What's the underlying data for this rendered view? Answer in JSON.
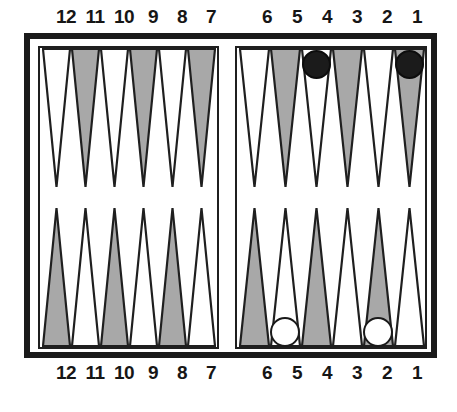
{
  "figure": {
    "kind": "backgammon-board-diagram",
    "caption_faint": "",
    "colors": {
      "frame": "#1a1a1a",
      "point_light": "#ffffff",
      "point_dark": "#a8a8a8",
      "point_outline": "#1f1f1f",
      "checker_white": "#ffffff",
      "checker_black": "#1b1b1b",
      "background": "#ffffff"
    }
  },
  "top_labels": {
    "left_group": [
      "12",
      "11",
      "10",
      "9",
      "8",
      "7"
    ],
    "right_group": [
      "6",
      "5",
      "4",
      "3",
      "2",
      "1"
    ]
  },
  "bottom_labels": {
    "left_group": [
      "12",
      "11",
      "10",
      "9",
      "8",
      "7"
    ],
    "right_group": [
      "6",
      "5",
      "4",
      "3",
      "2",
      "1"
    ]
  },
  "board": {
    "quadrants": {
      "top_left": {
        "name": "top-left-quadrant",
        "point_numbers": [
          "12",
          "11",
          "10",
          "9",
          "8",
          "7"
        ],
        "point_shades": [
          "light",
          "dark",
          "light",
          "dark",
          "light",
          "dark"
        ],
        "checkers": []
      },
      "top_right": {
        "name": "top-right-quadrant",
        "point_numbers": [
          "6",
          "5",
          "4",
          "3",
          "2",
          "1"
        ],
        "point_shades": [
          "light",
          "dark",
          "light",
          "dark",
          "light",
          "dark"
        ],
        "checkers": [
          {
            "point": "4",
            "color": "black",
            "count": 1
          },
          {
            "point": "1",
            "color": "black",
            "count": 1
          }
        ]
      },
      "bottom_left": {
        "name": "bottom-left-quadrant",
        "point_numbers": [
          "12",
          "11",
          "10",
          "9",
          "8",
          "7"
        ],
        "point_shades": [
          "dark",
          "light",
          "dark",
          "light",
          "dark",
          "light"
        ],
        "checkers": []
      },
      "bottom_right": {
        "name": "bottom-right-quadrant",
        "point_numbers": [
          "6",
          "5",
          "4",
          "3",
          "2",
          "1"
        ],
        "point_shades": [
          "dark",
          "light",
          "dark",
          "light",
          "dark",
          "light"
        ],
        "checkers": [
          {
            "point": "5",
            "color": "white",
            "count": 1
          },
          {
            "point": "2",
            "color": "white",
            "count": 1
          }
        ]
      }
    },
    "checker_summary": {
      "black_points": [
        "4",
        "1"
      ],
      "white_points": [
        "5",
        "2"
      ],
      "black_total": 2,
      "white_total": 2
    }
  }
}
